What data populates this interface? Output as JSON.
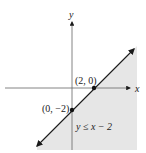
{
  "figure": {
    "axis_labels": {
      "x": "x",
      "y": "y"
    },
    "points": [
      {
        "label": "(2, 0)",
        "x": 2,
        "y": 0
      },
      {
        "label": "(0, −2)",
        "x": 0,
        "y": -2
      }
    ],
    "boundary_line": "y = x − 2",
    "inequality_label": "y ≤ x − 2",
    "shaded_region": "below and right of the line (solid boundary included)",
    "colors": {
      "shade": "#e6e6e6",
      "line": "#1a1a1a",
      "axis": "#555555"
    }
  }
}
